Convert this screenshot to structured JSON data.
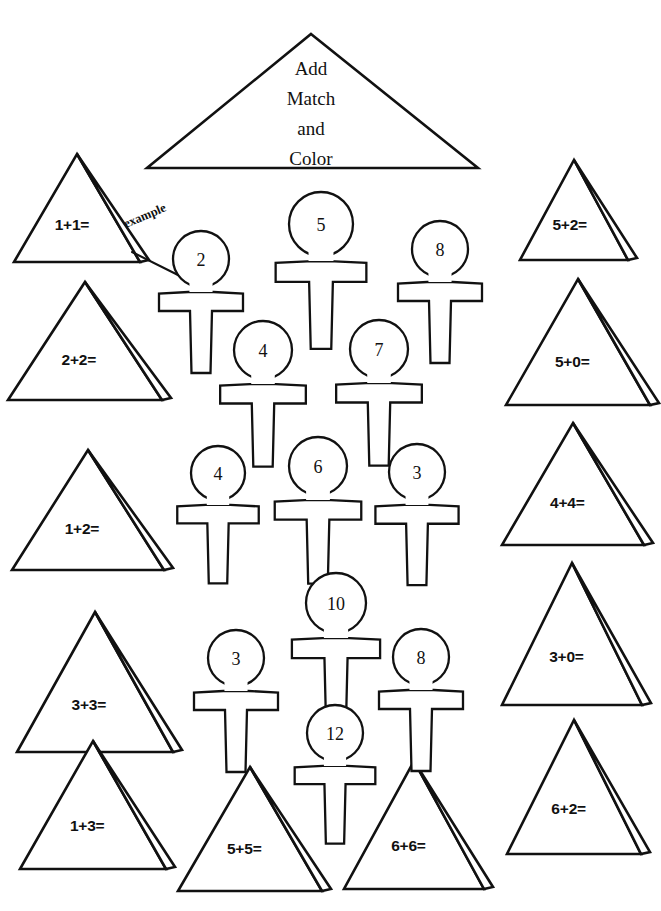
{
  "page": {
    "kind": "math-worksheet",
    "background_color": "#ffffff",
    "ink_color": "#111111",
    "width": 661,
    "height": 911
  },
  "title": {
    "shape": "triangle",
    "lines": [
      "Add",
      "Match",
      "and",
      "Color"
    ],
    "line1": "Add",
    "line2": "Match",
    "line3": "and",
    "line4": "Color"
  },
  "example": {
    "label": "example",
    "from_shape": "1+1=",
    "to_shape": "2",
    "rotation_deg": -23
  },
  "triangles": [
    {
      "id": "tri-1-1",
      "equation": "1+1=",
      "column": "left",
      "row": 1,
      "cx": 77,
      "base_y": 262,
      "half_w": 63,
      "height": 108
    },
    {
      "id": "tri-2-2",
      "equation": "2+2=",
      "column": "left",
      "row": 2,
      "cx": 85,
      "base_y": 400,
      "half_w": 77,
      "height": 118
    },
    {
      "id": "tri-1-2",
      "equation": "1+2=",
      "column": "left",
      "row": 3,
      "cx": 88,
      "base_y": 570,
      "half_w": 76,
      "height": 120
    },
    {
      "id": "tri-3-3",
      "equation": "3+3=",
      "column": "left",
      "row": 4,
      "cx": 95,
      "base_y": 752,
      "half_w": 78,
      "height": 140
    },
    {
      "id": "tri-1-3",
      "equation": "1+3=",
      "column": "left",
      "row": 5,
      "cx": 93,
      "base_y": 869,
      "half_w": 73,
      "height": 128
    },
    {
      "id": "tri-5-2",
      "equation": "5+2=",
      "column": "right",
      "row": 1,
      "cx": 574,
      "base_y": 260,
      "half_w": 54,
      "height": 100
    },
    {
      "id": "tri-5-0",
      "equation": "5+0=",
      "column": "right",
      "row": 2,
      "cx": 578,
      "base_y": 405,
      "half_w": 72,
      "height": 126
    },
    {
      "id": "tri-4-4",
      "equation": "4+4=",
      "column": "right",
      "row": 3,
      "cx": 573,
      "base_y": 545,
      "half_w": 71,
      "height": 122
    },
    {
      "id": "tri-3-0",
      "equation": "3+0=",
      "column": "right",
      "row": 4,
      "cx": 572,
      "base_y": 705,
      "half_w": 70,
      "height": 142
    },
    {
      "id": "tri-6-2",
      "equation": "6+2=",
      "column": "right",
      "row": 5,
      "cx": 574,
      "base_y": 854,
      "half_w": 67,
      "height": 134
    },
    {
      "id": "tri-5-5",
      "equation": "5+5=",
      "column": "bottom",
      "row": 6,
      "cx": 250,
      "base_y": 891,
      "half_w": 72,
      "height": 124
    },
    {
      "id": "tri-6-6",
      "equation": "6+6=",
      "column": "bottom",
      "row": 6,
      "cx": 414,
      "base_y": 889,
      "half_w": 70,
      "height": 128
    }
  ],
  "ankhs": [
    {
      "id": "ankh-2",
      "number": "2",
      "cx": 201,
      "loop_cy": 259,
      "loop_r": 28,
      "scale": 1.0
    },
    {
      "id": "ankh-5",
      "number": "5",
      "cx": 321,
      "loop_cy": 224,
      "loop_r": 32,
      "scale": 1.08
    },
    {
      "id": "ankh-8a",
      "number": "8",
      "cx": 440,
      "loop_cy": 249,
      "loop_r": 28,
      "scale": 1.0
    },
    {
      "id": "ankh-4a",
      "number": "4",
      "cx": 263,
      "loop_cy": 350,
      "loop_r": 29,
      "scale": 1.02
    },
    {
      "id": "ankh-7",
      "number": "7",
      "cx": 379,
      "loop_cy": 349,
      "loop_r": 29,
      "scale": 1.02
    },
    {
      "id": "ankh-4b",
      "number": "4",
      "cx": 218,
      "loop_cy": 473,
      "loop_r": 27,
      "scale": 0.97
    },
    {
      "id": "ankh-6",
      "number": "6",
      "cx": 318,
      "loop_cy": 466,
      "loop_r": 29,
      "scale": 1.03
    },
    {
      "id": "ankh-3a",
      "number": "3",
      "cx": 417,
      "loop_cy": 472,
      "loop_r": 28,
      "scale": 0.99
    },
    {
      "id": "ankh-3b",
      "number": "3",
      "cx": 236,
      "loop_cy": 658,
      "loop_r": 28,
      "scale": 1.0
    },
    {
      "id": "ankh-10",
      "number": "10",
      "cx": 336,
      "loop_cy": 603,
      "loop_r": 30,
      "scale": 1.05
    },
    {
      "id": "ankh-8b",
      "number": "8",
      "cx": 421,
      "loop_cy": 657,
      "loop_r": 28,
      "scale": 1.0
    },
    {
      "id": "ankh-12",
      "number": "12",
      "cx": 335,
      "loop_cy": 733,
      "loop_r": 28,
      "scale": 0.96
    }
  ]
}
